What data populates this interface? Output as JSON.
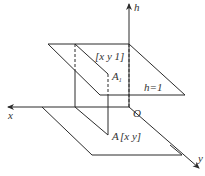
{
  "diagram": {
    "type": "3d-coordinate-projection",
    "axes": {
      "h": {
        "label": "h"
      },
      "x": {
        "label": "x"
      },
      "y": {
        "label": "y"
      },
      "origin": {
        "label": "O"
      }
    },
    "planes": {
      "upper": {
        "label": "h=1"
      },
      "lower": {
        "label": ""
      }
    },
    "points": {
      "A1": {
        "label": "A",
        "subscript": "1",
        "coords_label": "[x  y  1]"
      },
      "A": {
        "label": "A",
        "coords_label": "[x   y]"
      }
    },
    "colors": {
      "stroke": "#2b2b2b",
      "text": "#333333",
      "background": "#ffffff"
    }
  }
}
